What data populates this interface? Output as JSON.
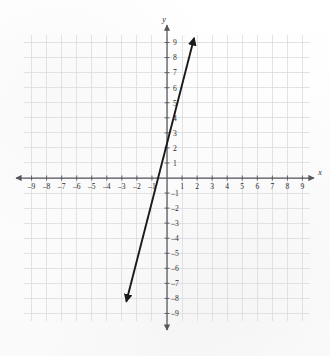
{
  "figure": {
    "title": "",
    "background_color": "#fdfdfd",
    "grid_color": "#d9d9de",
    "axis_color": "#55555c",
    "line_color": "#1a1a1a"
  },
  "axis_labels": {
    "x": "x",
    "y": "y"
  },
  "x_tick_labels": [
    "–9",
    "–8",
    "–7",
    "–6",
    "–5",
    "–4",
    "–3",
    "–2",
    "–1",
    "1",
    "2",
    "3",
    "4",
    "5",
    "6",
    "7",
    "8",
    "9"
  ],
  "y_tick_labels": [
    "9",
    "8",
    "7",
    "6",
    "5",
    "4",
    "3",
    "2",
    "1",
    "–1",
    "–2",
    "–3",
    "–4",
    "–5",
    "–6",
    "–7",
    "–8",
    "–9"
  ],
  "chart_data": {
    "type": "line",
    "title": "",
    "xlabel": "x",
    "ylabel": "y",
    "xlim": [
      -9.5,
      9.5
    ],
    "ylim": [
      -9.5,
      9.5
    ],
    "grid": true,
    "grid_step": 1,
    "legend": "none",
    "x_ticks": [
      -9,
      -8,
      -7,
      -6,
      -5,
      -4,
      -3,
      -2,
      -1,
      1,
      2,
      3,
      4,
      5,
      6,
      7,
      8,
      9
    ],
    "y_ticks": [
      9,
      8,
      7,
      6,
      5,
      4,
      3,
      2,
      1,
      -1,
      -2,
      -3,
      -4,
      -5,
      -6,
      -7,
      -8,
      -9
    ],
    "series": [
      {
        "name": "y = 4x",
        "equation": "y = 4x",
        "slope": 4,
        "intercept": 0,
        "arrows": "both",
        "x": [
          -2.7,
          1.8
        ],
        "values": [
          -10.8,
          7.2
        ],
        "endpoints": [
          {
            "x": -2.7,
            "y": -8.2
          },
          {
            "x": 1.8,
            "y": 9.3
          }
        ],
        "passes_through": [
          {
            "x": 0,
            "y": 0
          },
          {
            "x": 1,
            "y": 4
          },
          {
            "x": -1,
            "y": -4
          },
          {
            "x": 2,
            "y": 8
          },
          {
            "x": -2,
            "y": -8
          }
        ]
      }
    ]
  }
}
